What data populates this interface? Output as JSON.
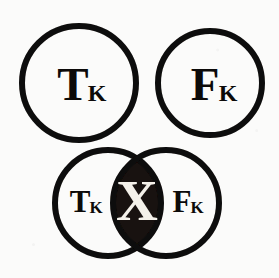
{
  "figure": {
    "kind": "venn-diagram-illustration",
    "background_color": "#fbfbfa",
    "ink_color": "#0c0a09",
    "intersection_fill_color": "#181210",
    "intersection_glyph_color": "#f4f1ea",
    "width": 279,
    "height": 278
  },
  "top_row": {
    "left_circle": {
      "label_main": "T",
      "label_sub": "K",
      "label_full": "TK",
      "center_x": 79,
      "center_y": 83,
      "radius": 57,
      "stroke_width": 6
    },
    "right_circle": {
      "label_main": "F",
      "label_sub": "K",
      "label_full": "FK",
      "center_x": 210,
      "center_y": 83,
      "radius": 52,
      "stroke_width": 6
    }
  },
  "bottom_venn": {
    "left_circle": {
      "label_main": "T",
      "label_sub": "K",
      "label_full": "TK",
      "center_x": 108,
      "center_y": 203,
      "radius": 53,
      "stroke_width": 6
    },
    "right_circle": {
      "label_main": "F",
      "label_sub": "K",
      "label_full": "FK",
      "center_x": 166,
      "center_y": 203,
      "radius": 53,
      "stroke_width": 6
    },
    "intersection": {
      "glyph": "X",
      "center_x": 137,
      "center_y": 203,
      "fill": "#181210",
      "glyph_color": "#f4f1ea"
    }
  }
}
